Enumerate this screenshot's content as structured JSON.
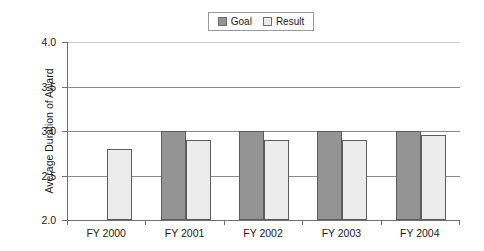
{
  "chart_data": {
    "type": "bar",
    "title": "",
    "xlabel": "",
    "ylabel": "Average Duration of Award",
    "categories": [
      "FY 2000",
      "FY 2001",
      "FY 2002",
      "FY 2003",
      "FY 2004"
    ],
    "series": [
      {
        "name": "Goal",
        "color": "#949494",
        "values": [
          null,
          3.0,
          3.0,
          3.0,
          3.0
        ]
      },
      {
        "name": "Result",
        "color": "#ececec",
        "values": [
          2.8,
          2.9,
          2.9,
          2.9,
          2.96
        ]
      }
    ],
    "ylim": [
      2.0,
      4.0
    ],
    "yticks": [
      "2.0",
      "2.5",
      "3.0",
      "3.5",
      "4.0"
    ],
    "ytick_values": [
      2.0,
      2.5,
      3.0,
      3.5,
      4.0
    ],
    "grid": true,
    "legend_position": "top-center"
  },
  "legend": {
    "entries": [
      {
        "label": "Goal",
        "swatch": "dark-gray-swatch-icon"
      },
      {
        "label": "Result",
        "swatch": "light-gray-swatch-icon"
      }
    ]
  }
}
